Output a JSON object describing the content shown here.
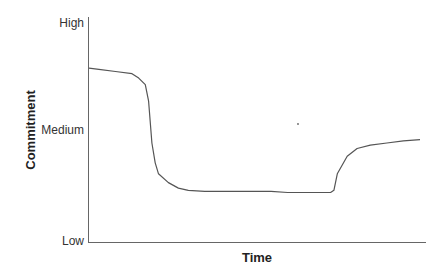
{
  "chart_data": {
    "type": "line",
    "title": "",
    "xlabel": "Time",
    "ylabel": "Commitment",
    "y_tick_labels": [
      "High",
      "Medium",
      "Low"
    ],
    "x_tick_labels": [],
    "grid": false,
    "legend": null,
    "series": [
      {
        "name": "Commitment",
        "color": "#555555",
        "points": [
          {
            "t": 0.0,
            "level": 0.79
          },
          {
            "t": 0.03,
            "level": 0.785
          },
          {
            "t": 0.08,
            "level": 0.775
          },
          {
            "t": 0.13,
            "level": 0.765
          },
          {
            "t": 0.15,
            "level": 0.745
          },
          {
            "t": 0.17,
            "level": 0.715
          },
          {
            "t": 0.18,
            "level": 0.64
          },
          {
            "t": 0.19,
            "level": 0.45
          },
          {
            "t": 0.2,
            "level": 0.36
          },
          {
            "t": 0.21,
            "level": 0.31
          },
          {
            "t": 0.24,
            "level": 0.27
          },
          {
            "t": 0.27,
            "level": 0.245
          },
          {
            "t": 0.3,
            "level": 0.235
          },
          {
            "t": 0.35,
            "level": 0.23
          },
          {
            "t": 0.55,
            "level": 0.23
          },
          {
            "t": 0.6,
            "level": 0.225
          },
          {
            "t": 0.73,
            "level": 0.225
          },
          {
            "t": 0.74,
            "level": 0.235
          },
          {
            "t": 0.75,
            "level": 0.31
          },
          {
            "t": 0.78,
            "level": 0.39
          },
          {
            "t": 0.81,
            "level": 0.425
          },
          {
            "t": 0.85,
            "level": 0.44
          },
          {
            "t": 0.9,
            "level": 0.45
          },
          {
            "t": 0.95,
            "level": 0.46
          },
          {
            "t": 1.0,
            "level": 0.465
          }
        ]
      }
    ],
    "ylim": [
      0,
      1
    ],
    "xlim": [
      0,
      1
    ]
  },
  "axes": {
    "y_label": "Commitment",
    "x_label": "Time",
    "ticks": {
      "high": "High",
      "medium": "Medium",
      "low": "Low"
    }
  },
  "colors": {
    "axis": "#666666",
    "line": "#555555",
    "text": "#222222"
  }
}
